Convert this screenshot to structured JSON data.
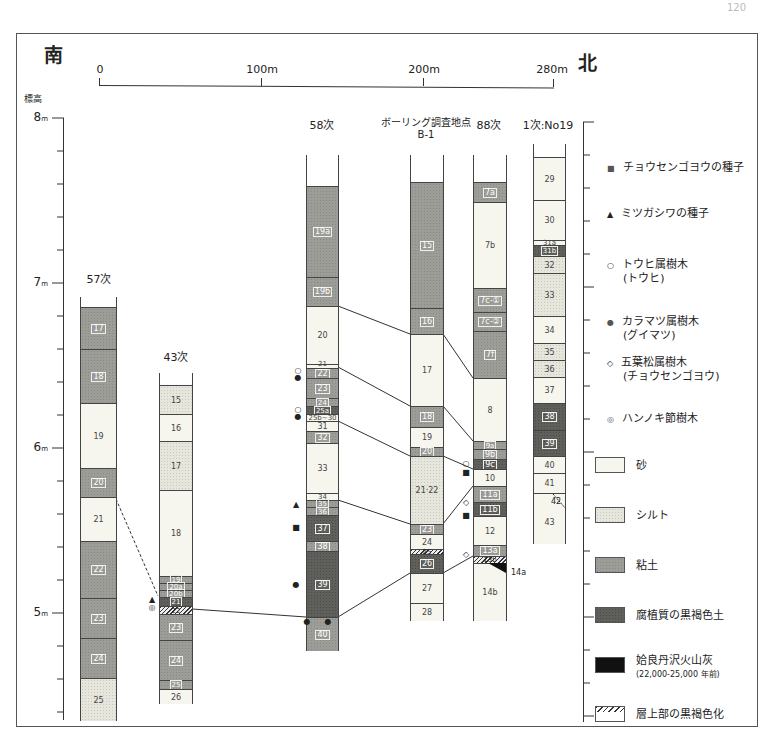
{
  "page_number": "120",
  "direction": {
    "south": "南",
    "north": "北"
  },
  "scale_bar": {
    "labels": [
      "0",
      "100m",
      "200m",
      "280m"
    ]
  },
  "elevation_axis": {
    "title": "標高",
    "labels": [
      {
        "value": "8",
        "unit": "m"
      },
      {
        "value": "7",
        "unit": "m"
      },
      {
        "value": "6",
        "unit": "m"
      },
      {
        "value": "5",
        "unit": "m"
      }
    ]
  },
  "columns": [
    {
      "title": "57次",
      "layers": [
        "17",
        "18",
        "19",
        "20",
        "21",
        "22",
        "23",
        "24",
        "25"
      ]
    },
    {
      "title": "43次",
      "layers": [
        "15",
        "16",
        "17",
        "18",
        "19",
        "20a",
        "20b",
        "21",
        "22",
        "23",
        "24",
        "25",
        "26"
      ]
    },
    {
      "title": "58次",
      "layers": [
        "19a",
        "19b",
        "20",
        "21",
        "22",
        "23",
        "24",
        "25a",
        "25b~30",
        "31",
        "32",
        "33",
        "34",
        "35",
        "36",
        "37",
        "38",
        "39",
        "40"
      ]
    },
    {
      "title": "ボーリング調査地点",
      "subtitle": "B-1",
      "layers": [
        "15",
        "16",
        "17",
        "18",
        "19",
        "20",
        "21·22",
        "23",
        "24",
        "25",
        "26",
        "27",
        "28"
      ]
    },
    {
      "title": "88次",
      "layers": [
        "7a",
        "7b",
        "7c-①",
        "7c-②",
        "7f",
        "8",
        "9a",
        "9b",
        "9c",
        "10",
        "11a",
        "11b",
        "12",
        "13a",
        "13b",
        "14a",
        "14b"
      ]
    },
    {
      "title": "1次:No19",
      "layers": [
        "29",
        "30",
        "31a",
        "31b",
        "32",
        "33",
        "34",
        "35",
        "36",
        "37",
        "38",
        "39",
        "40",
        "41",
        "42",
        "43"
      ]
    }
  ],
  "legend": {
    "symbols": [
      {
        "glyph": "■",
        "label": "チョウセンゴヨウの種子"
      },
      {
        "glyph": "▲",
        "label": "ミツガシワの種子"
      },
      {
        "glyph": "○",
        "label": "トウヒ属樹木",
        "sub": "(トウヒ)"
      },
      {
        "glyph": "●",
        "label": "カラマツ属樹木",
        "sub": "(グイマツ)"
      },
      {
        "glyph": "◇",
        "label": "五葉松属樹木",
        "sub": "(チョウセンゴヨウ)"
      },
      {
        "glyph": "◎",
        "label": "ハンノキ節樹木"
      }
    ],
    "swatches": [
      {
        "label": "砂"
      },
      {
        "label": "シルト"
      },
      {
        "label": "粘土"
      },
      {
        "label": "腐植質の黒褐色土"
      },
      {
        "label": "姶良丹沢火山灰",
        "sub": "(22,000-25,000 年前)"
      },
      {
        "label": "層上部の黒褐色化"
      }
    ]
  }
}
